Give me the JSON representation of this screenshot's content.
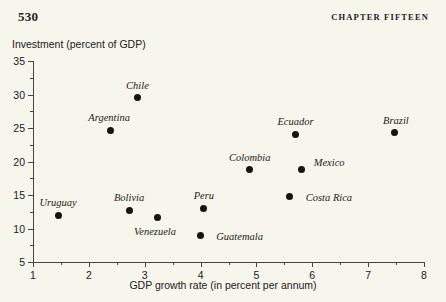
{
  "page": {
    "folio": "530",
    "chapter_title": "CHAPTER FIFTEEN"
  },
  "chart_data": {
    "type": "scatter",
    "title": "",
    "xlabel": "GDP growth rate (in percent per annum)",
    "ylabel": "Investment (percent of GDP)",
    "xlim": [
      1,
      8
    ],
    "ylim": [
      5,
      35
    ],
    "xticks": [
      1,
      2,
      3,
      4,
      5,
      6,
      7,
      8
    ],
    "yticks": [
      5,
      10,
      15,
      20,
      25,
      30,
      35
    ],
    "xtick_labels": [
      "1",
      "2",
      "3",
      "4",
      "5",
      "6",
      "7",
      "8"
    ],
    "ytick_labels": [
      "5",
      "10",
      "15",
      "20",
      "25",
      "30",
      "35"
    ],
    "minor_ticks": true,
    "grid": false,
    "legend": "none",
    "marker_color": "#141410",
    "axis_color": "#46463c",
    "background_color": "#f7f6ec",
    "points": [
      {
        "label": "Uruguay",
        "x": 1.45,
        "y": 12.0,
        "label_dx": 0,
        "label_dy": -13
      },
      {
        "label": "Argentina",
        "x": 2.38,
        "y": 24.7,
        "label_dx": -1,
        "label_dy": -13
      },
      {
        "label": "Bolivia",
        "x": 2.72,
        "y": 12.7,
        "label_dx": 0,
        "label_dy": -13
      },
      {
        "label": "Chile",
        "x": 2.87,
        "y": 29.5,
        "label_dx": 0,
        "label_dy": -13
      },
      {
        "label": "Venezuela",
        "x": 3.22,
        "y": 11.6,
        "label_dx": -2,
        "label_dy": 13
      },
      {
        "label": "Guatemala",
        "x": 4.0,
        "y": 9.0,
        "label_dx": 39,
        "label_dy": 1
      },
      {
        "label": "Peru",
        "x": 4.06,
        "y": 13.0,
        "label_dx": 0,
        "label_dy": -13
      },
      {
        "label": "Colombia",
        "x": 4.88,
        "y": 18.8,
        "label_dx": 0,
        "label_dy": -13
      },
      {
        "label": "Ecuador",
        "x": 5.7,
        "y": 24.1,
        "label_dx": 0,
        "label_dy": -13
      },
      {
        "label": "Costa Rica",
        "x": 5.6,
        "y": 14.8,
        "label_dx": 39,
        "label_dy": 1
      },
      {
        "label": "Mexico",
        "x": 5.8,
        "y": 18.8,
        "label_dx": 28,
        "label_dy": -8
      },
      {
        "label": "Brazil",
        "x": 7.48,
        "y": 24.3,
        "label_dx": 1,
        "label_dy": -13
      }
    ]
  }
}
